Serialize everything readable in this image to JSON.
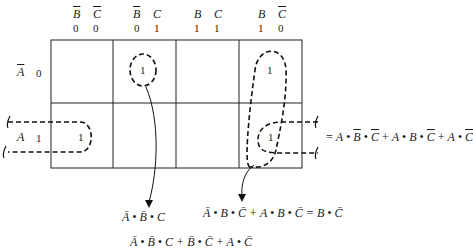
{
  "kmap": {
    "columns": [
      {
        "vars": [
          {
            "name": "B",
            "negated": true
          },
          {
            "name": "C",
            "negated": true
          }
        ],
        "bits": [
          "0",
          "0"
        ]
      },
      {
        "vars": [
          {
            "name": "B",
            "negated": true
          },
          {
            "name": "C",
            "negated": false
          }
        ],
        "bits": [
          "0",
          "1"
        ]
      },
      {
        "vars": [
          {
            "name": "B",
            "negated": false
          },
          {
            "name": "C",
            "negated": false
          }
        ],
        "bits": [
          "1",
          "1"
        ]
      },
      {
        "vars": [
          {
            "name": "B",
            "negated": false
          },
          {
            "name": "C",
            "negated": true
          }
        ],
        "bits": [
          "1",
          "0"
        ]
      }
    ],
    "rows": [
      {
        "var": "A",
        "negated": true,
        "bit": "0",
        "cells": [
          "",
          "1",
          "",
          "1"
        ]
      },
      {
        "var": "A",
        "negated": false,
        "bit": "1",
        "cells": [
          "1",
          "",
          "",
          "1"
        ]
      }
    ]
  },
  "labels": {
    "col0_v1": "B",
    "col0_v2": "C",
    "col0_b1": "0",
    "col0_b2": "0",
    "col1_v1": "B",
    "col1_v2": "C",
    "col1_b1": "0",
    "col1_b2": "1",
    "col2_v1": "B",
    "col2_v2": "C",
    "col2_b1": "1",
    "col2_b2": "1",
    "col3_v1": "B",
    "col3_v2": "C",
    "col3_b1": "1",
    "col3_b2": "0",
    "row0_var": "A",
    "row0_bit": "0",
    "row1_var": "A",
    "row1_bit": "1",
    "one": "1"
  },
  "expressions": {
    "row_a_group": "= A • B̄ • C̄ + A • B • C̄ + A • C̄",
    "row_a_parts": {
      "eq": "=",
      "t1": [
        "A",
        "B",
        "C"
      ],
      "t2": [
        "A",
        "B",
        "C"
      ],
      "t3": [
        "A",
        "C"
      ],
      "plus": "+",
      "dot": "•"
    },
    "group_single": "Ā • B̄ • C",
    "group_pair": "Ā • B • C̄ + A • B • C̄ = B • C̄",
    "bottom_partial": "Ā • B̄ • C + B̄ • C̄ + A • C̄"
  }
}
